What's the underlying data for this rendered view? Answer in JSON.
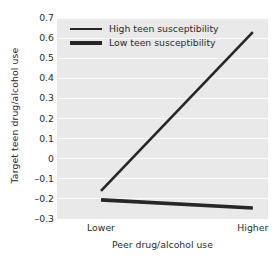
{
  "chart_data": {
    "type": "line",
    "title": "",
    "xlabel": "Peer drug/alcohol use",
    "ylabel": "Target teen drug/alcohol use",
    "categories": [
      "Lower",
      "Higher"
    ],
    "x": [
      0,
      1
    ],
    "xlim": [
      -0.29,
      1.1
    ],
    "ylim": [
      -0.3,
      0.7
    ],
    "yticks": [
      0.7,
      0.6,
      0.5,
      0.4,
      0.3,
      0.2,
      0.1,
      0,
      -0.1,
      -0.2,
      -0.3
    ],
    "ytick_labels": [
      "0.7",
      "0.6",
      "0.5",
      "0.4",
      "0.3",
      "0.2",
      "0.1",
      "0",
      "–0.1",
      "–0.2",
      "–0.3"
    ],
    "grid": true,
    "grid_axis": "y",
    "legend_position": "top-left-inside",
    "panel_background": "#e9e9e9",
    "gridline_color": "#fbfbfb",
    "series": [
      {
        "name": "High teen susceptibility",
        "values": [
          -0.16,
          0.63
        ],
        "color": "#262626",
        "line_width": 2.6
      },
      {
        "name": "Low teen susceptibility",
        "values": [
          -0.205,
          -0.245
        ],
        "color": "#262626",
        "line_width": 3.6
      }
    ]
  },
  "axes": {
    "y_title": "Target teen drug/alcohol use",
    "x_title": "Peer drug/alcohol use",
    "y_tick_labels": [
      "0.7",
      "0.6",
      "0.5",
      "0.4",
      "0.3",
      "0.2",
      "0.1",
      "0",
      "–0.1",
      "–0.2",
      "–0.3"
    ],
    "x_tick_labels": [
      "Lower",
      "Higher"
    ]
  },
  "legend": {
    "items": [
      {
        "label": "High teen susceptibility",
        "style": "thin"
      },
      {
        "label": "Low teen susceptibility",
        "style": "thick"
      }
    ]
  }
}
